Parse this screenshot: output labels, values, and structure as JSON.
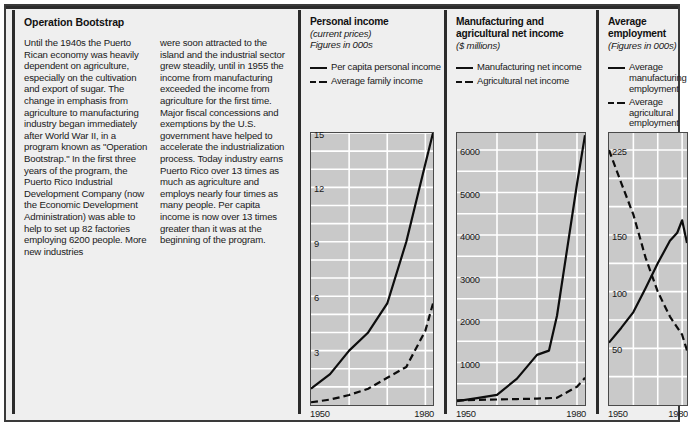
{
  "article": {
    "title": "Operation Bootstrap",
    "column_1": "Until the 1940s the Puerto Rican economy was heavily dependent on agriculture, especially on the cultivation and export of sugar. The change in emphasis from agriculture to manufacturing industry began immediately after World War II, in a program known as \"Operation Bootstrap.\" In the first three years of the program, the Puerto Rico Industrial Development Company (now the Economic Development Administration) was able to help to set up 82 factories employing 6200 people. More new industries",
    "column_2": "were soon attracted to the island and the industrial sector grew steadily, until in 1955 the income from manufacturing exceeded the income from agriculture for the first time. Major fiscal concessions and exemptions by the U.S. government have helped to accelerate the industrialization process. Today industry earns Puerto Rico over 13 times as much as agriculture and employs nearly four times as many people. Per capita income is now over 13 times greater than it was at the beginning of the program."
  },
  "chart_data": [
    {
      "type": "line",
      "title": "Personal income",
      "subtitle_1": "(current prices)",
      "subtitle_2": "Figures in 000s",
      "xlabel": "",
      "ylabel": "",
      "xlim": [
        1950,
        1982
      ],
      "ylim": [
        0,
        15
      ],
      "xticks": [
        "1950",
        "1980"
      ],
      "yticks": [
        "3",
        "6",
        "9",
        "12",
        "15"
      ],
      "ytick_values": [
        3,
        6,
        9,
        12,
        15
      ],
      "grid": true,
      "legend_position": "above-plot",
      "series": [
        {
          "name": "Per capita personal income",
          "style": "solid",
          "x": [
            1950,
            1955,
            1960,
            1965,
            1970,
            1975,
            1980,
            1982
          ],
          "values": [
            0.9,
            1.7,
            3.0,
            4.0,
            5.6,
            9.0,
            13.3,
            15.0
          ]
        },
        {
          "name": "Average family income",
          "style": "dashed",
          "x": [
            1950,
            1955,
            1960,
            1965,
            1970,
            1975,
            1980,
            1982
          ],
          "values": [
            0.15,
            0.3,
            0.55,
            0.9,
            1.5,
            2.1,
            4.1,
            5.6
          ]
        }
      ]
    },
    {
      "type": "line",
      "title_line_1": "Manufacturing and",
      "title_line_2": "agricultural net income",
      "subtitle_1": "($ millions)",
      "xlabel": "",
      "ylabel": "",
      "xlim": [
        1950,
        1982
      ],
      "ylim": [
        0,
        6400
      ],
      "xticks": [
        "1950",
        "1980"
      ],
      "yticks": [
        "1000",
        "2000",
        "3000",
        "4000",
        "5000",
        "6000"
      ],
      "ytick_values": [
        1000,
        2000,
        3000,
        4000,
        5000,
        6000
      ],
      "grid": true,
      "legend_position": "above-plot",
      "series": [
        {
          "name": "Manufacturing net income",
          "style": "solid",
          "x": [
            1950,
            1955,
            1960,
            1965,
            1970,
            1973,
            1975,
            1980,
            1982
          ],
          "values": [
            90,
            160,
            240,
            620,
            1180,
            1280,
            2100,
            5200,
            6350
          ]
        },
        {
          "name": "Agricultural net income",
          "style": "dashed",
          "x": [
            1950,
            1955,
            1960,
            1965,
            1970,
            1975,
            1980,
            1982
          ],
          "values": [
            110,
            120,
            130,
            140,
            150,
            170,
            430,
            640
          ]
        }
      ]
    },
    {
      "type": "line",
      "title": "Average employment",
      "subtitle_1": "(Figures in 000s)",
      "xlabel": "",
      "ylabel": "",
      "xlim": [
        1950,
        1982
      ],
      "ylim": [
        0,
        240
      ],
      "xticks": [
        "1950",
        "1980"
      ],
      "yticks": [
        "50",
        "100",
        "150",
        "225"
      ],
      "ytick_values": [
        50,
        100,
        150,
        225
      ],
      "grid": true,
      "legend_position": "above-plot",
      "series": [
        {
          "name": "Average manufacturing employment",
          "style": "solid",
          "x": [
            1950,
            1955,
            1960,
            1965,
            1970,
            1975,
            1978,
            1980,
            1982
          ],
          "values": [
            55,
            68,
            82,
            103,
            125,
            145,
            152,
            163,
            143
          ]
        },
        {
          "name": "Average agricultural employment",
          "style": "dashed",
          "x": [
            1950,
            1955,
            1960,
            1965,
            1970,
            1975,
            1980,
            1982
          ],
          "values": [
            225,
            196,
            168,
            130,
            100,
            78,
            62,
            48
          ]
        }
      ]
    }
  ]
}
